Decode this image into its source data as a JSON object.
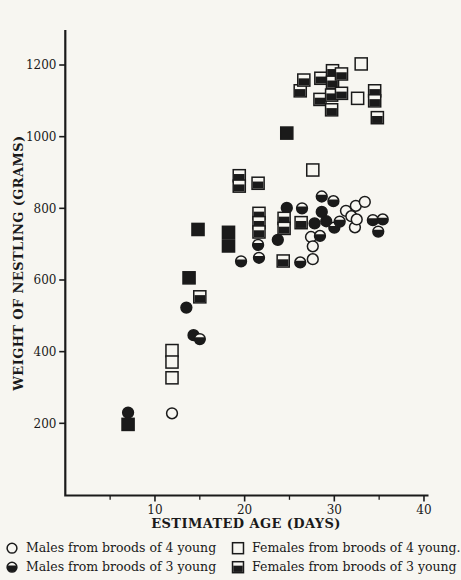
{
  "page": {
    "paper": "#f7f6f1",
    "ink": "#1a1a1a"
  },
  "chart_data": {
    "type": "scatter",
    "title": "",
    "xlabel": "ESTIMATED AGE (DAYS)",
    "ylabel": "WEIGHT OF NESTLING (GRAMS)",
    "xlim": [
      0,
      40.5
    ],
    "ylim": [
      0,
      1300
    ],
    "x_ticks": [
      10,
      20,
      30,
      40
    ],
    "x_minor_ticks": [
      5,
      15,
      25,
      35
    ],
    "y_ticks": [
      200,
      400,
      600,
      800,
      1000,
      1200
    ],
    "grid": false,
    "legend_position": "below-plot, two columns",
    "point_format": "[age_days, weight_grams, printed_fully_black]",
    "series": [
      {
        "name": "Males from broods of 4 young",
        "marker": "open-circle",
        "points": [
          [
            11.9,
            228
          ],
          [
            27.4,
            720
          ],
          [
            27.6,
            694
          ],
          [
            27.6,
            658
          ],
          [
            31.3,
            793
          ],
          [
            31.9,
            778
          ],
          [
            32.3,
            747
          ],
          [
            32.4,
            807
          ],
          [
            32.5,
            769
          ],
          [
            33.4,
            818
          ]
        ]
      },
      {
        "name": "Males from broods of 3 young",
        "marker": "half-circle",
        "points": [
          [
            7,
            230,
            1
          ],
          [
            13.5,
            523,
            1
          ],
          [
            14.3,
            446,
            1
          ],
          [
            15,
            435
          ],
          [
            19.6,
            652
          ],
          [
            21.5,
            698
          ],
          [
            21.6,
            662
          ],
          [
            23.7,
            712,
            1
          ],
          [
            24.7,
            801,
            1
          ],
          [
            26.2,
            649
          ],
          [
            26.4,
            800
          ],
          [
            27.8,
            758,
            1
          ],
          [
            28.4,
            723
          ],
          [
            28.6,
            833
          ],
          [
            28.6,
            790,
            1
          ],
          [
            29.1,
            764,
            1
          ],
          [
            29.9,
            820
          ],
          [
            30,
            746
          ],
          [
            30.6,
            763
          ],
          [
            34.3,
            767
          ],
          [
            34.9,
            735
          ],
          [
            35.4,
            769
          ]
        ]
      },
      {
        "name": "Females from broods of 4 young.",
        "marker": "open-square",
        "points": [
          [
            11.9,
            403
          ],
          [
            11.9,
            371
          ],
          [
            11.9,
            327
          ],
          [
            27.6,
            907
          ],
          [
            32.6,
            1107
          ],
          [
            33,
            1203
          ]
        ]
      },
      {
        "name": "Females from broods of 3 young",
        "marker": "half-square",
        "points": [
          [
            7,
            197,
            1
          ],
          [
            13.8,
            606,
            1
          ],
          [
            14.8,
            741,
            1
          ],
          [
            15,
            553
          ],
          [
            18.2,
            733,
            1
          ],
          [
            18.2,
            695,
            1
          ],
          [
            19.4,
            891
          ],
          [
            19.4,
            862
          ],
          [
            21.5,
            870
          ],
          [
            21.6,
            786
          ],
          [
            21.6,
            760
          ],
          [
            21.6,
            734
          ],
          [
            24.3,
            653
          ],
          [
            24.4,
            772
          ],
          [
            24.4,
            744
          ],
          [
            24.7,
            1010,
            1
          ],
          [
            26.2,
            1128
          ],
          [
            26.3,
            760
          ],
          [
            26.6,
            1158
          ],
          [
            28.4,
            1104
          ],
          [
            28.5,
            1163
          ],
          [
            29.7,
            1116
          ],
          [
            29.7,
            1075
          ],
          [
            29.8,
            1184
          ],
          [
            29.8,
            1152
          ],
          [
            30.8,
            1175
          ],
          [
            30.8,
            1121
          ],
          [
            34.5,
            1128
          ],
          [
            34.5,
            1100
          ],
          [
            34.8,
            1053
          ]
        ]
      }
    ]
  }
}
